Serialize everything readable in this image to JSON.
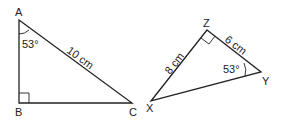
{
  "triangle_abc": {
    "vertices": {
      "A": "A",
      "B": "B",
      "C": "C"
    },
    "angle_a": "53°",
    "hypotenuse_ac": "10 cm",
    "right_angle_at": "B"
  },
  "triangle_xyz": {
    "vertices": {
      "X": "X",
      "Y": "Y",
      "Z": "Z"
    },
    "angle_y": "53°",
    "side_xz": "8 cm",
    "side_zy": "6 cm",
    "right_angle_at": "Z"
  },
  "colors": {
    "stroke": "#222222",
    "background": "#ffffff"
  }
}
